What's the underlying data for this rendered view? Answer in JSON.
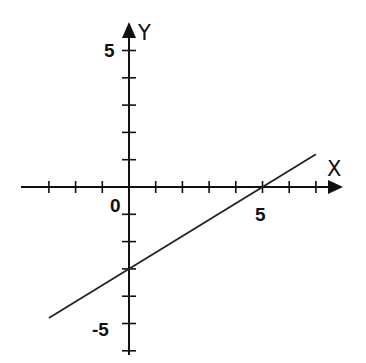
{
  "chart_data": {
    "type": "line",
    "title": "",
    "xlabel": "X",
    "ylabel": "Y",
    "xlim": [
      -4,
      8
    ],
    "ylim": [
      -6,
      6
    ],
    "grid": false,
    "legend": null,
    "x_ticks": [
      -3,
      -2,
      -1,
      0,
      1,
      2,
      3,
      4,
      5,
      6,
      7
    ],
    "y_ticks": [
      -6,
      -5,
      -4,
      -3,
      -2,
      -1,
      1,
      2,
      3,
      4,
      5
    ],
    "tick_labels": {
      "x": [
        "0",
        "5"
      ],
      "y": [
        "5",
        "-5"
      ]
    },
    "series": [
      {
        "name": "y = 0.6x - 3",
        "x": [
          -3,
          0,
          5,
          7
        ],
        "y": [
          -4.8,
          -3,
          0,
          1.2
        ]
      }
    ],
    "annotations": {
      "x_intercept": 5,
      "y_intercept": -3,
      "slope": 0.6
    }
  },
  "labels": {
    "x_axis": "X",
    "y_axis": "Y",
    "origin": "0",
    "x_five": "5",
    "y_five": "5",
    "y_neg_five": "-5"
  },
  "colors": {
    "axis": "#111111",
    "line": "#222222",
    "background": "#ffffff"
  }
}
